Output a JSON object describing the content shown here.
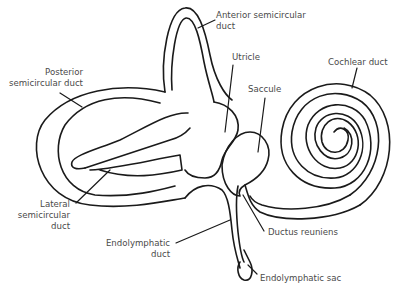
{
  "diagram": {
    "stroke_color": "#1a1a1a",
    "label_color": "#4a4a4a",
    "background": "#ffffff",
    "labels": {
      "anterior": "Anterior semicircular\nduct",
      "utricle": "Utricle",
      "cochlear": "Cochlear duct",
      "posterior": "Posterior\nsemicircular duct",
      "saccule": "Saccule",
      "lateral": "Lateral\nsemicircular\nduct",
      "endolymphatic_duct": "Endolymphatic\nduct",
      "ductus_reuniens": "Ductus reuniens",
      "endolymphatic_sac": "Endolymphatic sac"
    }
  }
}
